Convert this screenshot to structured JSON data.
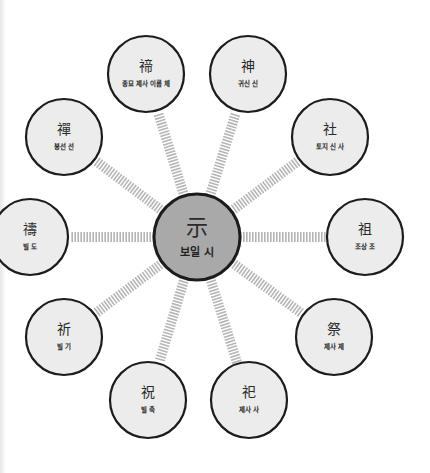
{
  "diagram": {
    "colors": {
      "center_fill": "#a9a9a9",
      "node_fill": "#ececec",
      "stroke": "#1c1c1c",
      "connector": "#b5b5b5"
    },
    "center": {
      "hanja": "示",
      "label": "보일 시"
    },
    "nodes": [
      {
        "id": "di",
        "hanja": "禘",
        "label": "종묘 제사 이름 체"
      },
      {
        "id": "sin",
        "hanja": "神",
        "label": "귀신 신"
      },
      {
        "id": "sa-she",
        "hanja": "社",
        "label": "토지 신 사"
      },
      {
        "id": "jo",
        "hanja": "祖",
        "label": "조상 조"
      },
      {
        "id": "je",
        "hanja": "祭",
        "label": "제사 제"
      },
      {
        "id": "sa-si",
        "hanja": "祀",
        "label": "제사 사"
      },
      {
        "id": "chuk",
        "hanja": "祝",
        "label": "빌 축"
      },
      {
        "id": "gi",
        "hanja": "祈",
        "label": "빌 기"
      },
      {
        "id": "do",
        "hanja": "禱",
        "label": "빌 도"
      },
      {
        "id": "seon",
        "hanja": "禪",
        "label": "봉선 선"
      }
    ]
  }
}
